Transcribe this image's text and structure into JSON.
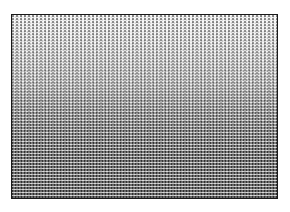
{
  "image": {
    "description": "Framed halftone dither gradient, light at top transitioning to dense dark crosshatch at bottom",
    "frame_color": "#1a1a1a",
    "background_color": "#ffffff",
    "gradient": {
      "direction": "top-to-bottom",
      "top_tone": "#f4f4f4",
      "bottom_tone": "#6a6a6a"
    }
  }
}
